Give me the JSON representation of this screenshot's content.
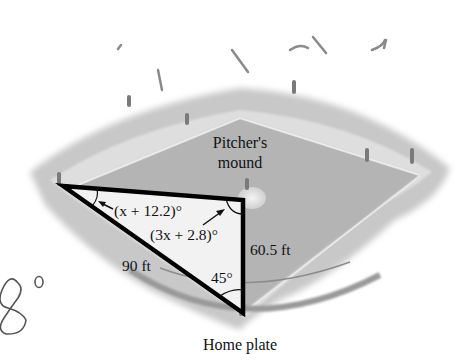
{
  "figure": {
    "type": "geometry-diagram",
    "labels": {
      "pitchers_mound_line1": "Pitcher's",
      "pitchers_mound_line2": "mound",
      "home_plate": "Home plate",
      "angle_top_left": "(x + 12.2)°",
      "angle_top_right": "(3x + 2.8)°",
      "angle_bottom": "45°",
      "side_hypotenuse": "90 ft",
      "side_vertical": "60.5 ft"
    },
    "handwriting": {
      "mark": "8°"
    },
    "colors": {
      "triangle_stroke": "#000000",
      "triangle_fill": "#f2f2f2",
      "field_dirt": "#bdbdbd",
      "field_grass": "#a8a8a8",
      "background": "#ffffff"
    },
    "triangle": {
      "vertices": {
        "first_base_corner": [
          63,
          186
        ],
        "mound_corner": [
          243,
          200
        ],
        "home_plate_corner": [
          243,
          313
        ]
      },
      "right_angle_at": "mound_corner"
    }
  }
}
